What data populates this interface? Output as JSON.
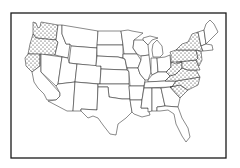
{
  "map": {
    "subject": "United States state outline map",
    "pattern_legend": "stippled",
    "colors": {
      "background": "#ffffff",
      "line": "#2a2a2a",
      "dot": "#222222"
    },
    "shaded_regions": [
      {
        "name": "Pacific Northwest",
        "states": [
          "Washington",
          "Oregon",
          "Northern California"
        ]
      },
      {
        "name": "Eastern Seaboard",
        "states": [
          "New York",
          "Pennsylvania",
          "New Jersey",
          "Delaware",
          "Maryland",
          "West Virginia",
          "Virginia",
          "North Carolina",
          "South Carolina"
        ]
      }
    ]
  }
}
